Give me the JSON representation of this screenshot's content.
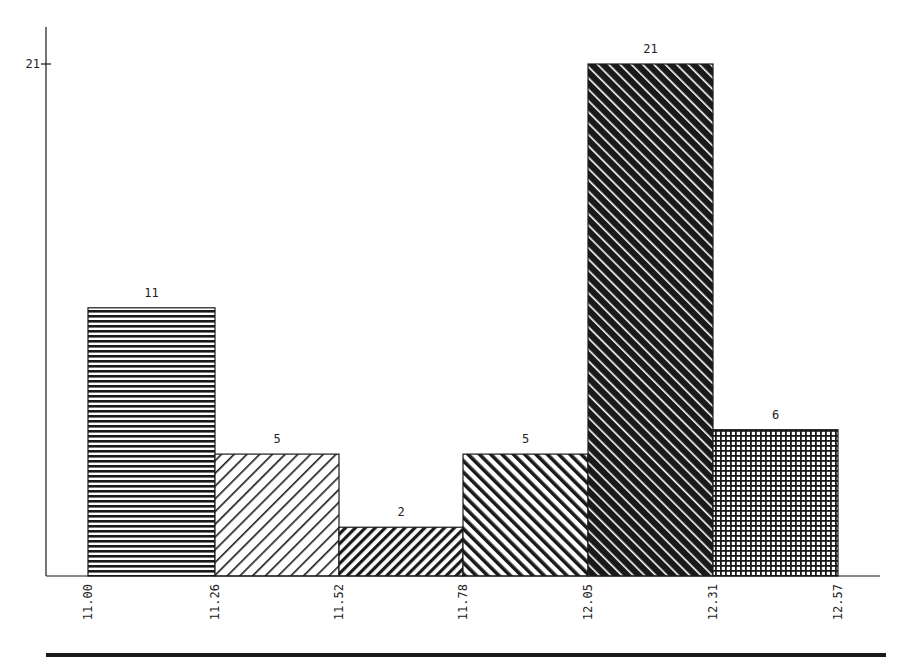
{
  "chart_data": {
    "type": "bar",
    "subtype": "histogram",
    "title": "",
    "xlabel": "",
    "ylabel": "",
    "bin_edges": [
      "11.00",
      "11.26",
      "11.52",
      "11.78",
      "12.05",
      "12.31",
      "12.57"
    ],
    "categories": [
      "11.00-11.26",
      "11.26-11.52",
      "11.52-11.78",
      "11.78-12.05",
      "12.05-12.31",
      "12.31-12.57"
    ],
    "values": [
      11,
      5,
      2,
      5,
      21,
      6
    ],
    "data_labels": [
      "11",
      "5",
      "2",
      "5",
      "21",
      "6"
    ],
    "patterns": [
      "horizontal-lines",
      "diagonal-forward-thin",
      "diagonal-forward-thick",
      "diagonal-back-thick",
      "diagonal-back-dense",
      "crosshatch-grid"
    ],
    "y_ticks": [
      "21"
    ],
    "ylim": [
      0,
      22
    ],
    "grid": false,
    "legend": null
  },
  "colors": {
    "ink": "#1a1a1a",
    "background": "#ffffff"
  }
}
